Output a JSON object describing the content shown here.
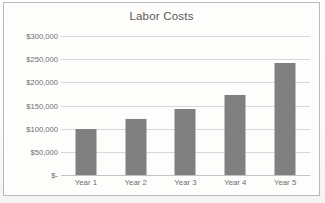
{
  "chart_data": {
    "type": "bar",
    "title": "Labor Costs",
    "xlabel": "",
    "ylabel": "",
    "categories": [
      "Year 1",
      "Year 2",
      "Year 3",
      "Year 4",
      "Year 5"
    ],
    "values": [
      100000,
      121000,
      142000,
      172000,
      242000
    ],
    "ylim": [
      0,
      300000
    ],
    "ytick_values": [
      0,
      50000,
      100000,
      150000,
      200000,
      250000,
      300000
    ],
    "ytick_labels": [
      "$-",
      "$50,000",
      "$100,000",
      "$150,000",
      "$200,000",
      "$250,000",
      "$300,000"
    ],
    "grid": true,
    "legend": false,
    "legend_position": "none",
    "series": [
      {
        "name": "Labor Costs",
        "values": [
          100000,
          121000,
          142000,
          172000,
          242000
        ]
      }
    ],
    "colors": {
      "bar": "#808080",
      "gridline": "#d8d8d8",
      "axis": "#c2c2c2",
      "title_text": "#585858",
      "tick_text": "#6d6d6d",
      "border": "#b9b9b9",
      "plot_background": "#fdfdfc"
    }
  }
}
